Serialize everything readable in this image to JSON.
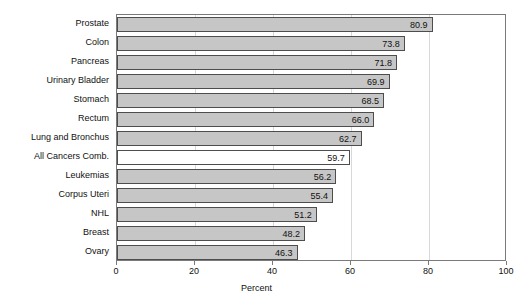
{
  "chart_data": {
    "type": "bar",
    "orientation": "horizontal",
    "title": "",
    "subtitle": "",
    "xlabel": "Percent",
    "ylabel": "",
    "xlim": [
      0,
      100
    ],
    "xticks": [
      0,
      20,
      40,
      60,
      80,
      100
    ],
    "xtick_labels": [
      "0",
      "20",
      "40",
      "60",
      "80",
      "100"
    ],
    "grid": "vertical",
    "legend": "none",
    "categories": [
      "Prostate",
      "Colon",
      "Pancreas",
      "Urinary Bladder",
      "Stomach",
      "Rectum",
      "Lung and Bronchus",
      "All Cancers Comb.",
      "Leukemias",
      "Corpus Uteri",
      "NHL",
      "Breast",
      "Ovary"
    ],
    "values": [
      80.9,
      73.8,
      71.8,
      69.9,
      68.5,
      66.0,
      62.7,
      59.7,
      56.2,
      55.4,
      51.2,
      48.2,
      46.3
    ],
    "value_labels": [
      "80.9",
      "73.8",
      "71.8",
      "69.9",
      "68.5",
      "66.0",
      "62.7",
      "59.7",
      "56.2",
      "55.4",
      "51.2",
      "48.2",
      "46.3"
    ],
    "highlighted_category": "All Cancers Comb.",
    "colors": {
      "bar_fill": "#c6c6c6",
      "bar_fill_highlight": "#ffffff",
      "bar_border": "#4d4d4d",
      "frame": "#7a7a7a",
      "gridline": "#d8d8d8",
      "text": "#111111",
      "background": "#ffffff"
    }
  }
}
